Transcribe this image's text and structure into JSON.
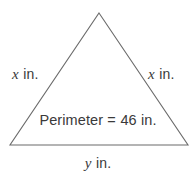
{
  "figure": {
    "type": "isosceles-triangle-diagram",
    "background_color": "#ffffff",
    "stroke_color": "#6b6b6b",
    "text_color": "#3a3a3a",
    "vertices": {
      "apex": [
        99,
        13
      ],
      "bottom_left": [
        10,
        145
      ],
      "bottom_right": [
        188,
        145
      ]
    }
  },
  "labels": {
    "left_side": {
      "variable": "x",
      "unit": "in."
    },
    "right_side": {
      "variable": "x",
      "unit": "in."
    },
    "base": {
      "variable": "y",
      "unit": "in."
    },
    "perimeter": {
      "name": "Perimeter",
      "equals": "=",
      "value": "46",
      "unit": "in."
    }
  }
}
